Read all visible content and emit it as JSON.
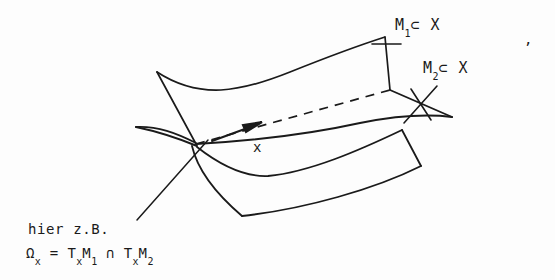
{
  "figure": {
    "background_color": "#fdfdfd",
    "ink_color": "#1a1a1a",
    "width": 555,
    "height": 280
  },
  "labels": {
    "m1": {
      "base": "M",
      "subscript": "1",
      "relation": "⊂ X",
      "full": "M₁ ⊂ X"
    },
    "m2": {
      "base": "M",
      "subscript": "2",
      "relation": "⊂ X",
      "full": "M₂ ⊂ X"
    },
    "point": "x",
    "annotation_line1": "hier z.B.",
    "formula": {
      "omega": "Ω",
      "omega_sub": "x",
      "equals": "=",
      "t1": "T",
      "t1_sub": "x",
      "m1": "M",
      "m1_sub": "1",
      "cap": "∩",
      "t2": "T",
      "t2_sub": "x",
      "m2": "M",
      "m2_sub": "2",
      "full": "Ωₓ = TₓM₁ ∩ TₓM₂"
    },
    "trailing_mark": ","
  },
  "geometry": {
    "surface_m1_upper": {
      "name": "M1 upper sheet",
      "top_edge": "M 157 72 C 215 104 300 64 385 37",
      "left_edge": "M 157 72 L 195 143",
      "right_edge": "M 385 37 L 390 90",
      "front_edge": "M 195 143 C 255 133 330 112 390 90"
    },
    "surface_m2": {
      "name": "M2 sheet",
      "far_edge_dashed": "M 195 143 L 390 90",
      "left_tip": "M 138 128 C 160 131 178 137 195 143",
      "upper_left_wing": "M 138 128 C 165 122 182 131 196 142",
      "right_corner": "M 390 90 L 452 118",
      "front_curve": "M 196 145 C 255 140 345 128 452 118"
    },
    "surface_lower": {
      "name": "lower sheet of M1",
      "inner_curve": "M 196 146 C 225 163 248 176 270 176 C 320 172 370 148 402 130",
      "right_edge": "M 402 130 L 420 165",
      "bottom_curve": "M 420 165 C 370 188 300 210 240 215",
      "left_curve": "M 240 215 C 210 190 196 168 190 147"
    },
    "tangent_arrow": {
      "name": "tangent vector at x",
      "path": "M 213 140 L 258 124",
      "arrowhead": "filled triangle at (258,124)"
    },
    "leaders": {
      "m1_tick": "M 373 44 L 403 44",
      "m1_tick_cross": "M 385 31 L 387 58",
      "m2_leader": "M 405 122 L 436 88",
      "m2_leader_cross": "M 412 88 L 430 122",
      "hier_leader": "M 138 219 L 207 141"
    }
  }
}
